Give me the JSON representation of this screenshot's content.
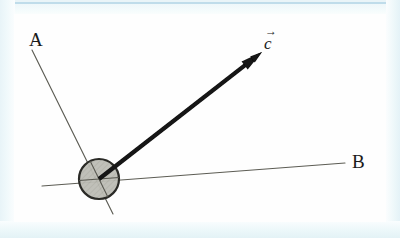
{
  "figure": {
    "canvas": {
      "width": 400,
      "height": 238
    },
    "background_color": "#fefefe",
    "frame_color": "#eef7fa",
    "frame_accent_color": "#bfdcea"
  },
  "labels": {
    "line_a": "A",
    "line_b": "B",
    "vector_c_letter": "c",
    "vector_c_arrow": "→"
  },
  "chart_data": {
    "type": "diagram",
    "title": "",
    "elements": [
      {
        "name": "line-a",
        "kind": "line",
        "label": "A",
        "x1": 32,
        "y1": 50,
        "x2": 113,
        "y2": 214,
        "color": "#5c5c54",
        "width": 1.1
      },
      {
        "name": "line-b",
        "kind": "line",
        "label": "B",
        "x1": 42,
        "y1": 186,
        "x2": 345,
        "y2": 163,
        "color": "#5c5c54",
        "width": 1.1
      },
      {
        "name": "vector-c",
        "kind": "arrow",
        "label": "c",
        "x1": 99,
        "y1": 179,
        "x2": 262,
        "y2": 52,
        "color": "#121212",
        "width": 4.2
      },
      {
        "name": "pivot-circle",
        "kind": "circle",
        "cx": 99,
        "cy": 179,
        "r": 20,
        "fill": "#b8b8b0",
        "stroke": "#2a2a26",
        "stroke_width": 2.2
      }
    ],
    "label_positions": [
      {
        "text": "A",
        "x": 36,
        "y": 42
      },
      {
        "text": "B",
        "x": 358,
        "y": 163
      },
      {
        "text": "c",
        "x": 272,
        "y": 45
      }
    ]
  }
}
